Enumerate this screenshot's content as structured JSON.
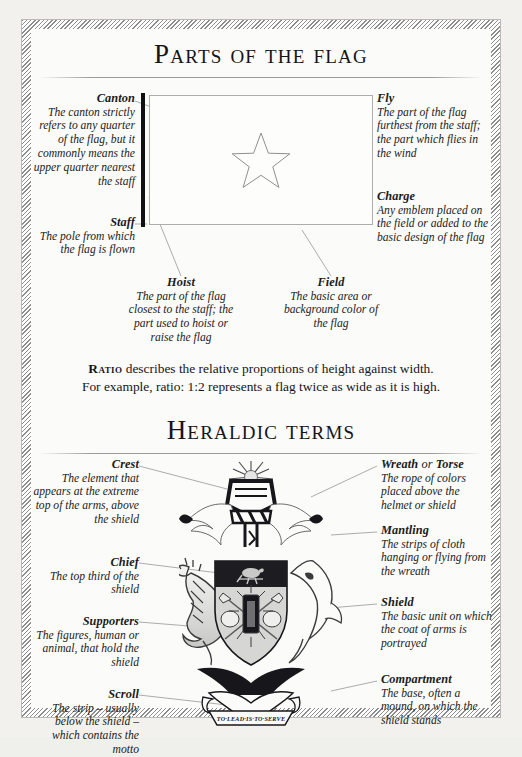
{
  "sections": {
    "flag": {
      "title": "Parts of the flag",
      "labels": {
        "canton": {
          "term": "Canton",
          "desc": "The canton strictly refers to any quarter of the flag, but it commonly means the upper quarter nearest the staff"
        },
        "staff": {
          "term": "Staff",
          "desc": "The pole from which the flag is flown"
        },
        "fly": {
          "term": "Fly",
          "desc": "The part of the flag furthest from the staff; the part which flies in the wind"
        },
        "charge": {
          "term": "Charge",
          "desc": "Any emblem placed on the field or added to the basic design of the flag"
        },
        "hoist": {
          "term": "Hoist",
          "desc": "The part of the flag closest to the staff; the part used to hoist or raise the flag"
        },
        "field": {
          "term": "Field",
          "desc": "The basic area or background color of the flag"
        }
      },
      "diagram": {
        "charge_icon": "five-pointed-star",
        "staff_icon": "flag-staff-bar"
      }
    },
    "ratio": {
      "term": "Ratio",
      "text_line1": "describes the relative proportions of height against width.",
      "text_line2": "For example, ratio: 1:2 represents a flag twice as wide as it is high."
    },
    "heraldry": {
      "title": "Heraldic terms",
      "labels": {
        "crest": {
          "term": "Crest",
          "desc": "The element that appears at the extreme top of the arms, above the shield"
        },
        "chief": {
          "term": "Chief",
          "desc": "The top third of the shield"
        },
        "supporters": {
          "term": "Supporters",
          "desc": "The figures, human or animal, that hold the shield"
        },
        "scroll": {
          "term": "Scroll",
          "desc": "The strip – usually below the shield – which contains the motto"
        },
        "wreath": {
          "term_a": "Wreath",
          "term_join": "or",
          "term_b": "Torse",
          "desc": "The rope of colors placed above the helmet or shield"
        },
        "mantling": {
          "term": "Mantling",
          "desc": "The strips of cloth hanging or flying from the wreath"
        },
        "shield": {
          "term": "Shield",
          "desc": "The basic unit on which the coat of arms is portrayed"
        },
        "compartment": {
          "term": "Compartment",
          "desc": "The base, often a mound, on which the shield stands"
        }
      },
      "coat_of_arms": {
        "motto": "TO·LEAD·IS·TO·SERVE",
        "supporter_left": "crocodile",
        "supporter_right": "shark",
        "crest_icon": "sunburst-over-helmet",
        "shield_charge": "bird-on-chief"
      }
    }
  },
  "colors": {
    "ink": "#15151a",
    "rule": "#9a9a96",
    "leader": "#9d9d99",
    "paper": "#fbfbf9",
    "frame": "#8d8d8d"
  }
}
